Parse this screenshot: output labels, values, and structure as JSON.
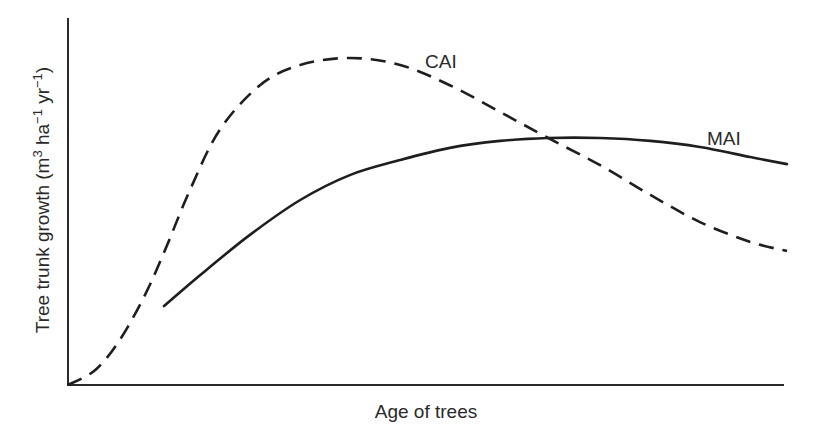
{
  "chart_data": {
    "type": "line",
    "title": "",
    "xlabel": "Age of trees",
    "ylabel": "Tree trunk growth (m3 ha-1 yr-1)",
    "ylabel_parts": {
      "prefix": "Tree trunk growth (m",
      "sup1": "3",
      "mid1": " ha",
      "sup2": "−1",
      "mid2": " yr",
      "sup3": "−1",
      "suffix": ")"
    },
    "xlim": [
      0,
      100
    ],
    "ylim": [
      0,
      100
    ],
    "grid": false,
    "ticks": false,
    "legend": "inline labels",
    "series": [
      {
        "name": "CAI",
        "style": "dashed",
        "label_pos": [
          50.2,
          88.0
        ],
        "x": [
          0,
          3.8,
          7.2,
          10.7,
          13.5,
          16.96,
          21.1,
          26.7,
          32.3,
          39.2,
          46.2,
          53.1,
          60.1,
          66.8,
          74.0,
          81.0,
          87.9,
          94.9,
          100
        ],
        "y": [
          0,
          4.1,
          12.3,
          24.5,
          36.8,
          53.1,
          69.5,
          81.7,
          87.2,
          89.1,
          87.2,
          81.7,
          74.4,
          67.3,
          59.9,
          51.8,
          44.4,
          39.0,
          36.5
        ]
      },
      {
        "name": "MAI",
        "style": "solid",
        "label_pos": [
          90.5,
          65.0
        ],
        "x": [
          13.35,
          18.4,
          25.3,
          32.3,
          39.2,
          46.2,
          53.1,
          60.1,
          66.8,
          74.0,
          81.0,
          87.9,
          94.9,
          100
        ],
        "y": [
          21.5,
          29.97,
          40.9,
          50.4,
          57.2,
          61.3,
          64.6,
          66.5,
          67.3,
          67.3,
          66.5,
          64.85,
          62.1,
          60.2
        ]
      }
    ],
    "annotations": [
      {
        "text": "CAI",
        "near_series": "CAI"
      },
      {
        "text": "MAI",
        "near_series": "MAI"
      }
    ]
  }
}
